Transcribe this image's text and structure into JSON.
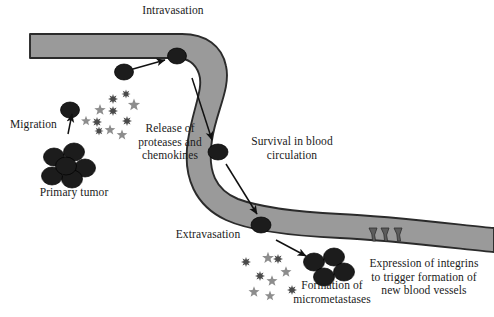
{
  "diagram": {
    "colors": {
      "vessel_fill": "#9a9a9a",
      "vessel_stroke": "#2b2b2b",
      "cell_fill": "#1c1c1c",
      "protease_burst": "#4a4a4a",
      "chemokine_star": "#8d8d8d",
      "text": "#1a1a1a",
      "arrow": "#111111",
      "background": "#ffffff"
    },
    "labels": [
      {
        "id": "intravasation",
        "text": "Intravasation",
        "x": 118,
        "y": 4,
        "w": 110,
        "align": "center"
      },
      {
        "id": "migration",
        "text": "Migration",
        "x": 10,
        "y": 118,
        "w": 58,
        "align": "left"
      },
      {
        "id": "release",
        "text": "Release of\nproteases and\nchemokines",
        "x": 128,
        "y": 122,
        "w": 84,
        "align": "center"
      },
      {
        "id": "primary-tumor",
        "text": "Primary tumor",
        "x": 32,
        "y": 186,
        "w": 84,
        "align": "center"
      },
      {
        "id": "survival",
        "text": "Survival in blood\ncirculation",
        "x": 242,
        "y": 135,
        "w": 100,
        "align": "center"
      },
      {
        "id": "extravasation",
        "text": "Extravasation",
        "x": 168,
        "y": 228,
        "w": 80,
        "align": "center"
      },
      {
        "id": "micrometastases",
        "text": "Formation of\nmicrometastases",
        "x": 290,
        "y": 279,
        "w": 84,
        "align": "center"
      },
      {
        "id": "integrins",
        "text": "Expression of integrins\nto trigger formation of\nnew blood vessels",
        "x": 364,
        "y": 257,
        "w": 120,
        "align": "center"
      }
    ],
    "cells": {
      "circulating": [
        {
          "id": "cell-intravasating",
          "cx": 124,
          "cy": 72,
          "rx": 9.5,
          "ry": 8.0
        },
        {
          "id": "cell-in-lumen-top",
          "cx": 177,
          "cy": 56,
          "rx": 9.5,
          "ry": 8.0
        },
        {
          "id": "cell-in-circulation",
          "cx": 218,
          "cy": 152,
          "rx": 10.0,
          "ry": 8.0
        },
        {
          "id": "cell-extravasating",
          "cx": 261,
          "cy": 225,
          "rx": 10.0,
          "ry": 8.0
        },
        {
          "id": "cell-migrating",
          "cx": 70,
          "cy": 110,
          "rx": 9.5,
          "ry": 8.0
        }
      ],
      "primary_tumor_cluster": [
        {
          "cx": 54,
          "cy": 157,
          "rx": 10.5,
          "ry": 9.0
        },
        {
          "cx": 74,
          "cy": 152,
          "rx": 10.5,
          "ry": 9.0
        },
        {
          "cx": 85,
          "cy": 168,
          "rx": 10.5,
          "ry": 9.0
        },
        {
          "cx": 72,
          "cy": 179,
          "rx": 10.5,
          "ry": 9.0
        },
        {
          "cx": 52,
          "cy": 176,
          "rx": 10.5,
          "ry": 9.0
        },
        {
          "cx": 66,
          "cy": 166,
          "rx": 10.5,
          "ry": 9.0
        }
      ],
      "micrometastases_cluster": [
        {
          "cx": 314,
          "cy": 262,
          "rx": 10.5,
          "ry": 9.0
        },
        {
          "cx": 334,
          "cy": 257,
          "rx": 10.5,
          "ry": 9.0
        },
        {
          "cx": 344,
          "cy": 272,
          "rx": 10.5,
          "ry": 9.0
        },
        {
          "cx": 324,
          "cy": 277,
          "rx": 10.5,
          "ry": 9.0
        }
      ]
    },
    "particles": {
      "upper_cluster": {
        "bursts": [
          {
            "cx": 113,
            "cy": 99,
            "r": 5.0
          },
          {
            "cx": 113,
            "cy": 111,
            "r": 5.0
          },
          {
            "cx": 126,
            "cy": 94,
            "r": 4.6
          },
          {
            "cx": 127,
            "cy": 121,
            "r": 5.0
          },
          {
            "cx": 97,
            "cy": 122,
            "r": 5.0
          },
          {
            "cx": 99,
            "cy": 131,
            "r": 4.6
          }
        ],
        "stars": [
          {
            "cx": 100,
            "cy": 110,
            "r": 6.0
          },
          {
            "cx": 134,
            "cy": 105,
            "r": 6.4
          },
          {
            "cx": 110,
            "cy": 130,
            "r": 5.6
          },
          {
            "cx": 122,
            "cy": 135,
            "r": 5.6
          },
          {
            "cx": 86,
            "cy": 121,
            "r": 5.2
          }
        ]
      },
      "lower_cluster": {
        "bursts": [
          {
            "cx": 246,
            "cy": 262,
            "r": 5.0
          },
          {
            "cx": 260,
            "cy": 276,
            "r": 5.0
          },
          {
            "cx": 278,
            "cy": 259,
            "r": 5.0
          },
          {
            "cx": 292,
            "cy": 290,
            "r": 5.0
          }
        ],
        "stars": [
          {
            "cx": 268,
            "cy": 258,
            "r": 6.2
          },
          {
            "cx": 286,
            "cy": 272,
            "r": 5.8
          },
          {
            "cx": 272,
            "cy": 281,
            "r": 5.8
          },
          {
            "cx": 254,
            "cy": 292,
            "r": 5.8
          },
          {
            "cx": 270,
            "cy": 296,
            "r": 5.4
          }
        ]
      }
    },
    "arrows": [
      {
        "id": "arrow-intravasation",
        "x1": 133,
        "y1": 69,
        "x2": 165,
        "y2": 60
      },
      {
        "id": "arrow-migration",
        "x1": 68,
        "y1": 134,
        "x2": 72,
        "y2": 114
      },
      {
        "id": "arrow-lumen-down",
        "x1": 192,
        "y1": 78,
        "x2": 212,
        "y2": 140
      },
      {
        "id": "arrow-to-extravasation",
        "x1": 226,
        "y1": 164,
        "x2": 257,
        "y2": 214
      },
      {
        "id": "arrow-to-micromets",
        "x1": 276,
        "y1": 240,
        "x2": 306,
        "y2": 256
      }
    ],
    "sprouts": [
      {
        "id": "sprout-1",
        "x": 373,
        "y": 228
      },
      {
        "id": "sprout-2",
        "x": 385,
        "y": 228
      },
      {
        "id": "sprout-3",
        "x": 398,
        "y": 228
      }
    ],
    "vessel": {
      "outer_path": "M 30 34 L 30 34 C 30 34 160 34 182 34 C 206 34 222 46 226 66 C 231 88 216 112 212 140 C 207 172 216 190 238 199 C 262 208 300 212 340 214 C 390 216 470 226 494 228 L 494 252 C 470 250 390 240 340 238 C 296 236 252 232 226 220 C 196 206 182 178 188 140 C 193 108 204 88 199 74 C 195 62 186 58 176 58 C 160 58 30 58 30 58 Z"
    }
  }
}
